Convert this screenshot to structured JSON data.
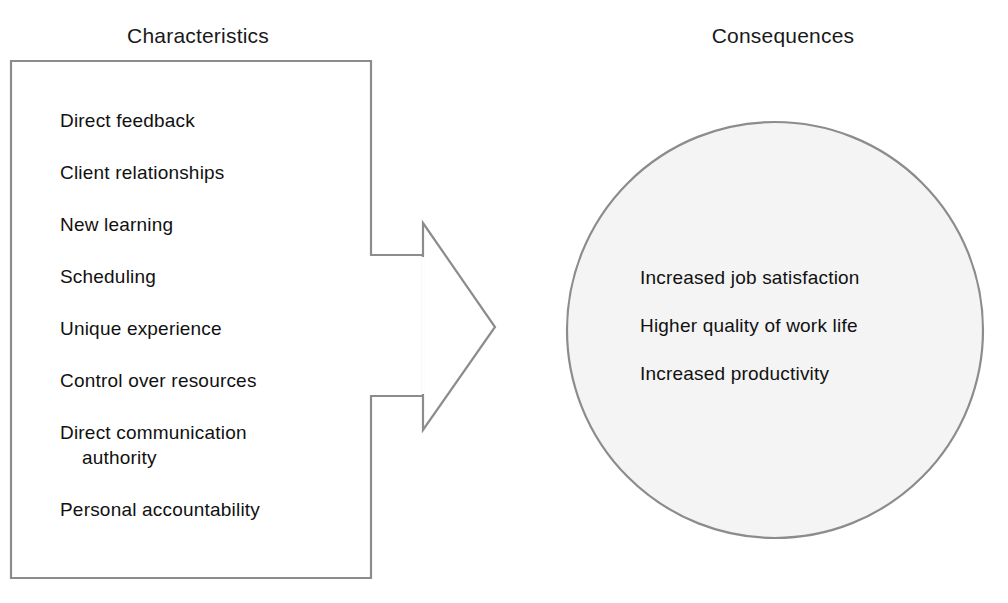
{
  "diagram": {
    "title_left": "Characteristics",
    "title_right": "Consequences",
    "characteristics": [
      {
        "text": "Direct feedback"
      },
      {
        "text": "Client relationships"
      },
      {
        "text": "New learning"
      },
      {
        "text": "Scheduling"
      },
      {
        "text": "Unique experience"
      },
      {
        "text": "Control over resources"
      },
      {
        "text": "Direct communication",
        "text2": "authority"
      },
      {
        "text": "Personal accountability"
      }
    ],
    "consequences": [
      {
        "text": "Increased job satisfaction"
      },
      {
        "text": "Higher quality of work life"
      },
      {
        "text": "Increased productivity"
      }
    ],
    "shapes": {
      "box_name": "characteristics-box",
      "arrow_name": "right-arrow",
      "circle_name": "consequences-circle"
    },
    "colors": {
      "stroke": "#8c8c8c",
      "circle_fill": "#f4f4f4",
      "box_fill": "#ffffff",
      "text": "#111111",
      "background": "#ffffff"
    }
  }
}
